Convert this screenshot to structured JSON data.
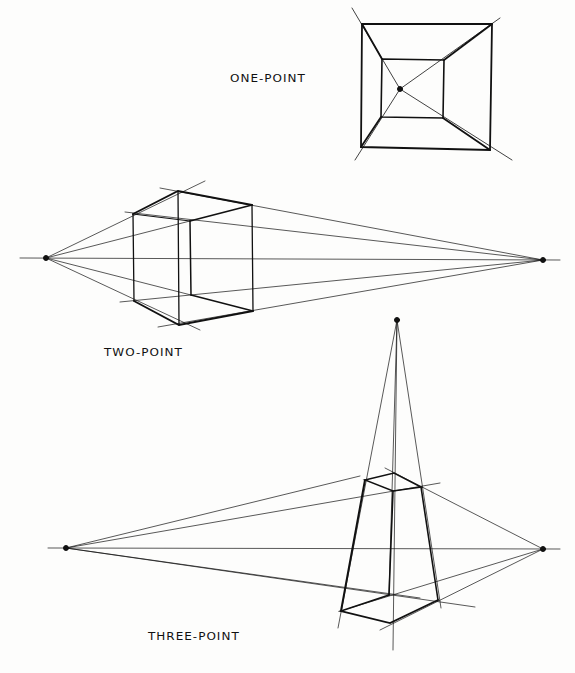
{
  "labels": {
    "one_point": "ONE-POINT",
    "two_point": "TWO-POINT",
    "three_point": "THREE-POINT"
  },
  "colors": {
    "ink": "#111111",
    "background": "#fdfdfc"
  }
}
